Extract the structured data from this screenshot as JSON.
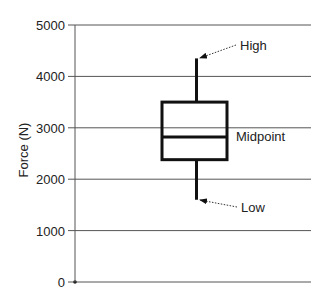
{
  "chart_data": {
    "type": "box",
    "title": "",
    "xlabel": "",
    "ylabel": "Force (N)",
    "ylim": [
      0,
      5000
    ],
    "yticks": [
      0,
      1000,
      2000,
      3000,
      4000,
      5000
    ],
    "ytick_labels": [
      "0",
      "1000",
      "2000",
      "3000",
      "4000",
      "5000"
    ],
    "grid": {
      "horizontal": true,
      "vertical": false
    },
    "legend": null,
    "boxes": [
      {
        "name": "",
        "high": 4350,
        "q3": 3500,
        "midpoint": 2820,
        "q1": 2380,
        "low": 1600
      }
    ],
    "annotations": [
      {
        "text": "High",
        "points_to": "high",
        "arrow": "dotted"
      },
      {
        "text": "Midpoint",
        "points_to": "midpoint",
        "arrow": "none"
      },
      {
        "text": "Low",
        "points_to": "low",
        "arrow": "dotted"
      }
    ]
  },
  "labels": {
    "ylabel": "Force (N)",
    "high": "High",
    "midpoint": "Midpoint",
    "low": "Low"
  },
  "colors": {
    "box_stroke": "#111111",
    "grid": "#555555",
    "axis": "#555555",
    "text": "#222222",
    "background": "#ffffff"
  }
}
